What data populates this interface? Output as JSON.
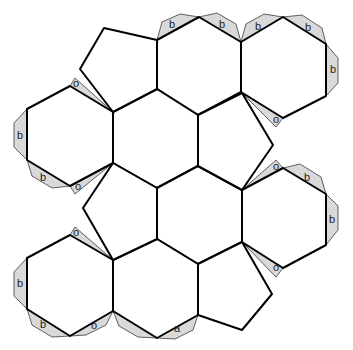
{
  "colors": {
    "edge": "#000000",
    "flap_fill": "#d9d9d9",
    "face_fill": "#ffffff",
    "background": "#ffffff"
  },
  "faces": {
    "pentagons": [
      {
        "id": "pentagon-top",
        "points": "104,28 157,40 157,89 113,112 80,69"
      },
      {
        "id": "pentagon-right-upper",
        "points": "198,115 242,93 273,145 242,190 198,166"
      },
      {
        "id": "pentagon-left-middle",
        "points": "113,163 157,188 157,239 113,260 83,208"
      },
      {
        "id": "pentagon-bottom",
        "points": "198,264 242,242 272,294 242,330 198,315"
      }
    ],
    "hexagons": [
      {
        "id": "hexagon-top-middle",
        "points": "157,40 199,17 241,42 241,92 198,115 157,89"
      },
      {
        "id": "hexagon-top-right",
        "points": "241,42 283,17 326,44 326,96 283,118 241,92"
      },
      {
        "id": "hexagon-left-upper",
        "points": "27,109 70,86 113,112 113,163 70,186 27,160"
      },
      {
        "id": "hexagon-center",
        "points": "113,112 157,89 198,115 198,166 157,188 113,163"
      },
      {
        "id": "hexagon-center-lower",
        "points": "157,188 198,166 242,190 242,242 198,264 157,239"
      },
      {
        "id": "hexagon-right-middle",
        "points": "242,190 283,168 326,194 326,245 283,268 242,242"
      },
      {
        "id": "hexagon-left-lower",
        "points": "27,258 70,235 113,260 113,311 70,336 27,309"
      },
      {
        "id": "hexagon-bottom-middle",
        "points": "113,260 157,239 198,264 198,315 157,338 113,311"
      }
    ]
  },
  "flaps": [
    {
      "id": "flap-b-1",
      "points": "157,40 162,22 180,14 199,17",
      "label": "b",
      "lx": 172,
      "ly": 25
    },
    {
      "id": "flap-b-2",
      "points": "199,17 217,13 236,24 241,42",
      "label": "b",
      "lx": 222,
      "ly": 25
    },
    {
      "id": "flap-b-3",
      "points": "241,42 246,24 264,14 283,17",
      "label": "b",
      "lx": 258,
      "ly": 27
    },
    {
      "id": "flap-b-4",
      "points": "283,17 302,15 322,28 326,44",
      "label": "b",
      "lx": 308,
      "ly": 28
    },
    {
      "id": "flap-b-5",
      "points": "326,44 338,58 338,83 326,96",
      "label": "b",
      "lx": 333,
      "ly": 70
    },
    {
      "id": "flap-o-1",
      "points": "283,118 276,127 241,92",
      "label": "o",
      "lx": 276,
      "ly": 120
    },
    {
      "id": "flap-o-2",
      "points": "70,86 75,78 113,112",
      "label": "o",
      "lx": 76,
      "ly": 84
    },
    {
      "id": "flap-b-6",
      "points": "27,109 14,123 14,147 27,160",
      "label": "b",
      "lx": 20,
      "ly": 136
    },
    {
      "id": "flap-b-7",
      "points": "27,160 32,176 52,188 70,186",
      "label": "b",
      "lx": 43,
      "ly": 178
    },
    {
      "id": "flap-o-3",
      "points": "70,186 75,194 113,163",
      "label": "o",
      "lx": 78,
      "ly": 187
    },
    {
      "id": "flap-shade-1",
      "points": "113,112 157,89 150,102",
      "label": "",
      "lx": 0,
      "ly": 0
    },
    {
      "id": "flap-shade-2",
      "points": "198,115 242,93 235,106",
      "label": "",
      "lx": 0,
      "ly": 0
    },
    {
      "id": "flap-shade-3",
      "points": "113,163 157,188 144,177",
      "label": "",
      "lx": 0,
      "ly": 0
    },
    {
      "id": "flap-shade-4",
      "points": "198,166 242,190 229,179",
      "label": "",
      "lx": 0,
      "ly": 0
    },
    {
      "id": "flap-o-4",
      "points": "283,168 276,160 242,190",
      "label": "o",
      "lx": 276,
      "ly": 167
    },
    {
      "id": "flap-b-8",
      "points": "283,168 300,164 321,177 326,194",
      "label": "b",
      "lx": 307,
      "ly": 178
    },
    {
      "id": "flap-b-9",
      "points": "326,194 338,206 338,230 326,245",
      "label": "b",
      "lx": 332,
      "ly": 220
    },
    {
      "id": "flap-o-5",
      "points": "283,268 276,277 242,242",
      "label": "o",
      "lx": 276,
      "ly": 268
    },
    {
      "id": "flap-shade-5",
      "points": "113,260 157,239 150,252",
      "label": "",
      "lx": 0,
      "ly": 0
    },
    {
      "id": "flap-shade-6",
      "points": "198,264 242,242 235,255",
      "label": "",
      "lx": 0,
      "ly": 0
    },
    {
      "id": "flap-o-6",
      "points": "70,235 75,227 113,260",
      "label": "o",
      "lx": 76,
      "ly": 233
    },
    {
      "id": "flap-b-10",
      "points": "27,258 14,272 14,296 27,309",
      "label": "b",
      "lx": 20,
      "ly": 284
    },
    {
      "id": "flap-b-11",
      "points": "27,309 32,325 52,337 70,336",
      "label": "b",
      "lx": 43,
      "ly": 325
    },
    {
      "id": "flap-o-7",
      "points": "70,336 86,335 106,325 113,311",
      "label": "o",
      "lx": 94,
      "ly": 326
    },
    {
      "id": "flap-a-1",
      "points": "113,311 119,326 138,337 157,338",
      "label": "",
      "lx": 0,
      "ly": 0
    },
    {
      "id": "flap-a-2",
      "points": "157,338 175,339 193,330 198,315",
      "label": "a",
      "lx": 177,
      "ly": 329
    }
  ]
}
